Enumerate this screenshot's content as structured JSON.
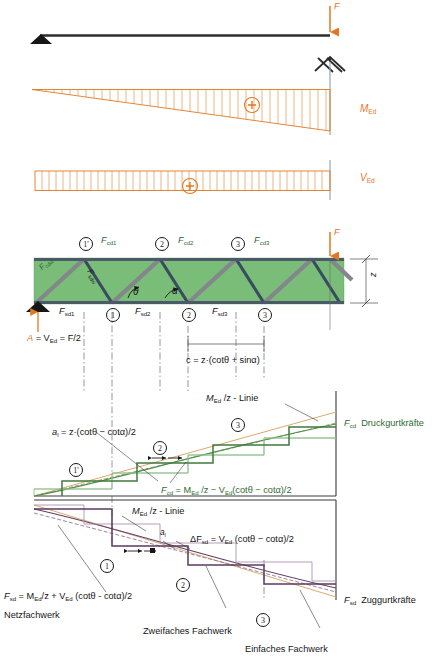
{
  "figure": {
    "colors": {
      "orange": "#e2781f",
      "green_line": "#3f7a3c",
      "green_fill": "#7cc17a",
      "purple": "#5f3f63",
      "blue_gray": "#3c4a5e",
      "strut_gray": "#8a8d90",
      "black": "#161616",
      "tan": "#d9a36a"
    }
  },
  "system": {
    "load_label": "F",
    "support_label": "A",
    "reaction_text_a": "A",
    "reaction_text_rest": " = V",
    "reaction_sub": "Ed",
    "reaction_tail": " = F/2"
  },
  "diagrams": {
    "moment": {
      "label_main": "M",
      "label_sub": "Ed",
      "sign": "+"
    },
    "shear": {
      "label_main": "V",
      "label_sub": "Ed",
      "sign": "+"
    }
  },
  "truss": {
    "depth_label": "z",
    "angle_theta": "θ",
    "angle_alpha": "α",
    "spacing_formula": "c = z·(cotθ + sinα)",
    "top_chord_forces": [
      {
        "name": "F",
        "sub": "cd1"
      },
      {
        "name": "F",
        "sub": "cd2"
      },
      {
        "name": "F",
        "sub": "cd3"
      }
    ],
    "bottom_chord_forces": [
      {
        "name": "F",
        "sub": "sd1"
      },
      {
        "name": "F",
        "sub": "sd2"
      },
      {
        "name": "F",
        "sub": "sd3"
      }
    ],
    "strut_label": {
      "name": "F",
      "sub": "cdw"
    },
    "tie_label": {
      "name": "F",
      "sub": "sdw"
    },
    "top_nodes": [
      "1'",
      "2",
      "3"
    ],
    "bottom_nodes": [
      "1",
      "2",
      "3"
    ]
  },
  "upper_chart": {
    "axis_label_name": "F",
    "axis_label_sub": "cd",
    "axis_label_text": "Druckgurtkräfte",
    "line_label": "M",
    "line_label_sub": "Ed",
    "line_label_tail": " /z - Linie",
    "shift_label_a": "a",
    "shift_label_sub": "l",
    "shift_formula": " = z·(cotθ − cotα)/2",
    "formula": "F",
    "formula_sub": "cd",
    "formula_tail_1": " = M",
    "formula_sub2": "Ed",
    "formula_tail_2": " /z − V",
    "formula_sub3": "Ed",
    "formula_tail_3": "(cotθ − cotα)/2",
    "nodes": [
      "1'",
      "2",
      "3"
    ]
  },
  "lower_chart": {
    "axis_label_name": "F",
    "axis_label_sub": "sd",
    "axis_label_text": "Zuggurtkräfte",
    "line_label": "M",
    "line_label_sub": "Ed",
    "line_label_tail": " /z - Linie",
    "shift_label_a": "a",
    "shift_label_sub": "l",
    "delta_label": "ΔF",
    "delta_sub": "sd",
    "delta_tail": " = V",
    "delta_sub2": "Ed",
    "delta_tail2": " (cotθ − cotα)/2",
    "formula": "F",
    "formula_sub": "sd",
    "formula_tail_1": " = M",
    "formula_sub2": "Ed",
    "formula_tail_2": "/z + V",
    "formula_sub3": "Ed",
    "formula_tail_3": " (cotθ - cotα)/2",
    "nodes": [
      "1",
      "2",
      "3"
    ],
    "legend": [
      "Netzfachwerk",
      "Zweifaches Fachwerk",
      "Einfaches Fachwerk"
    ]
  }
}
